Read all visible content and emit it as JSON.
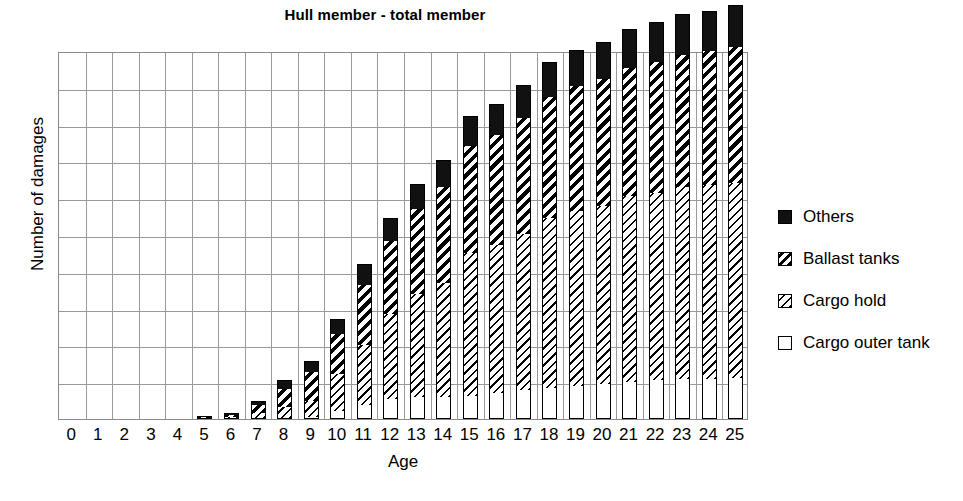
{
  "chart_data": {
    "type": "bar",
    "subtype": "stacked",
    "title": "Hull member - total member",
    "xlabel": "Age",
    "ylabel": "Number of damages",
    "grid": true,
    "legend_position": "right",
    "ylim": [
      0,
      10
    ],
    "y_gridline_count": 10,
    "y_tick_labels": [],
    "categories": [
      "0",
      "1",
      "2",
      "3",
      "4",
      "5",
      "6",
      "7",
      "8",
      "9",
      "10",
      "11",
      "12",
      "13",
      "14",
      "15",
      "16",
      "17",
      "18",
      "19",
      "20",
      "21",
      "22",
      "23",
      "24",
      "25"
    ],
    "series": [
      {
        "name": "Cargo outer tank",
        "fill": "white",
        "values": [
          0,
          0,
          0,
          0,
          0,
          0,
          0,
          0,
          0,
          0.05,
          0.22,
          0.38,
          0.55,
          0.6,
          0.6,
          0.62,
          0.72,
          0.78,
          0.85,
          0.9,
          0.95,
          1.0,
          1.05,
          1.1,
          1.1,
          1.12
        ]
      },
      {
        "name": "Cargo hold",
        "fill": "thin-diagonal-hatch",
        "values": [
          0,
          0,
          0,
          0,
          0,
          0.04,
          0.05,
          0.16,
          0.32,
          0.45,
          1.0,
          1.62,
          2.3,
          2.8,
          3.1,
          3.9,
          4.0,
          4.25,
          4.6,
          4.75,
          4.85,
          5.05,
          5.1,
          5.2,
          5.25,
          5.3
        ]
      },
      {
        "name": "Ballast tanks",
        "fill": "thick-diagonal-hatch",
        "values": [
          0,
          0,
          0,
          0,
          0,
          0.02,
          0.05,
          0.22,
          0.5,
          0.78,
          1.1,
          1.65,
          2.0,
          2.3,
          2.6,
          2.9,
          3.0,
          3.15,
          3.3,
          3.4,
          3.45,
          3.5,
          3.55,
          3.6,
          3.65,
          3.7
        ]
      },
      {
        "name": "Others",
        "fill": "solid-black",
        "values": [
          0,
          0,
          0,
          0,
          0,
          0.03,
          0.06,
          0.12,
          0.25,
          0.3,
          0.4,
          0.55,
          0.62,
          0.7,
          0.75,
          0.82,
          0.85,
          0.9,
          0.95,
          0.98,
          1.0,
          1.05,
          1.08,
          1.1,
          1.1,
          1.12
        ]
      }
    ]
  },
  "legend": {
    "items": [
      {
        "label": "Others",
        "swatch": "solid-black"
      },
      {
        "label": "Ballast tanks",
        "swatch": "thick-diagonal-hatch"
      },
      {
        "label": "Cargo hold",
        "swatch": "thin-diagonal-hatch"
      },
      {
        "label": "Cargo outer tank",
        "swatch": "white"
      }
    ]
  },
  "colors": {
    "series_others": "#111111",
    "series_outline": "#000000",
    "grid": "#9a9a9a",
    "axis": "#8a8a8a",
    "background": "#ffffff"
  }
}
